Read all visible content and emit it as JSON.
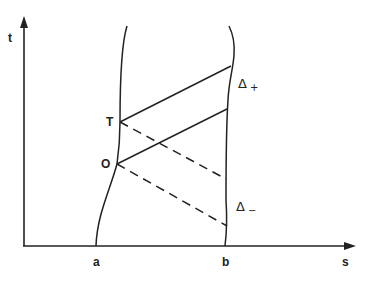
{
  "diagram": {
    "axes": {
      "vertical_label": "t",
      "horizontal_label": "s"
    },
    "points": {
      "T": "T",
      "O": "O"
    },
    "boundary_labels": {
      "left": "a",
      "right": "b"
    },
    "regions": {
      "delta_plus": {
        "symbol": "Δ",
        "sub": "+"
      },
      "delta_minus": {
        "symbol": "Δ",
        "sub": "−"
      }
    },
    "colors": {
      "ink": "#222222",
      "background": "#ffffff"
    }
  }
}
